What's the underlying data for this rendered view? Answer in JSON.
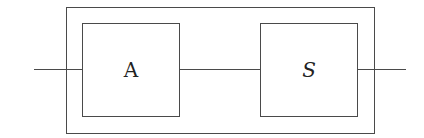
{
  "diagram": {
    "outer_block": {
      "label": ""
    },
    "blocks": [
      {
        "id": "A",
        "label": "A"
      },
      {
        "id": "S",
        "label": "S"
      }
    ],
    "connections": [
      {
        "from": "input",
        "to": "A"
      },
      {
        "from": "A",
        "to": "S"
      },
      {
        "from": "S",
        "to": "output"
      }
    ],
    "colors": {
      "stroke": "#4a4a4a",
      "background": "#ffffff"
    }
  }
}
